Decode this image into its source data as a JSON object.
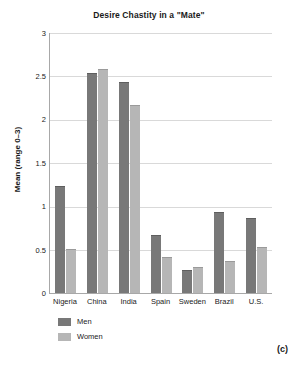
{
  "chart_data": {
    "type": "bar",
    "title": "Desire Chastity in a \"Mate\"",
    "xlabel": "",
    "ylabel": "Mean (range 0–3)",
    "ylim": [
      0,
      3
    ],
    "yticks": [
      "0",
      "0.5",
      "1",
      "1.5",
      "2",
      "2.5",
      "3"
    ],
    "grid": true,
    "legend_position": "below-left",
    "categories": [
      "Nigeria",
      "China",
      "India",
      "Spain",
      "Sweden",
      "Brazil",
      "U.S."
    ],
    "series": [
      {
        "name": "Men",
        "color": "#787878",
        "values": [
          1.23,
          2.54,
          2.43,
          0.67,
          0.27,
          0.94,
          0.87
        ]
      },
      {
        "name": "Women",
        "color": "#b6b6b6",
        "values": [
          0.51,
          2.59,
          2.17,
          0.41,
          0.3,
          0.37,
          0.53
        ]
      }
    ],
    "annotations": [
      "(c)"
    ]
  },
  "panel_label": "(c)"
}
